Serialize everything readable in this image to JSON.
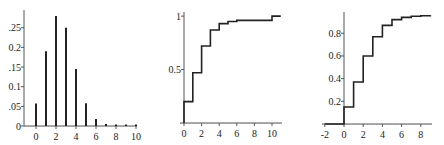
{
  "chart_data": [
    {
      "type": "bar",
      "title": "",
      "xlabel": "",
      "ylabel": "",
      "categories": [
        0,
        1,
        2,
        3,
        4,
        5,
        6,
        7,
        8,
        9,
        10
      ],
      "values": [
        0.057,
        0.19,
        0.28,
        0.25,
        0.145,
        0.058,
        0.018,
        0.005,
        0.002,
        0.001,
        0.0005
      ],
      "xlim": [
        -1,
        10.5
      ],
      "ylim": [
        0,
        0.29
      ],
      "xticks": [
        0,
        2,
        4,
        6,
        8,
        10
      ],
      "xtick_labels": [
        "0",
        "2",
        "4",
        "6",
        "8",
        "10"
      ],
      "yticks": [
        0,
        0.05,
        0.1,
        0.15,
        0.2,
        0.25
      ],
      "ytick_labels": [
        "0",
        ".05",
        "0.1",
        ".15",
        "0.2",
        ".25"
      ],
      "grid": false,
      "legend": null
    },
    {
      "type": "line",
      "style": "step",
      "title": "",
      "xlabel": "",
      "ylabel": "",
      "x": [
        0,
        1,
        2,
        3,
        4,
        5,
        6,
        7,
        8,
        9,
        10,
        11
      ],
      "values": [
        0.2,
        0.47,
        0.72,
        0.87,
        0.93,
        0.95,
        0.96,
        0.96,
        0.96,
        0.96,
        1.0,
        1.0
      ],
      "xlim": [
        -0.5,
        11.2
      ],
      "ylim": [
        0,
        1.02
      ],
      "xticks": [
        0,
        2,
        4,
        6,
        8,
        10
      ],
      "xtick_labels": [
        "0",
        "2",
        "4",
        "6",
        "8",
        "10"
      ],
      "yticks": [
        0.5,
        1
      ],
      "ytick_labels": [
        "0.5",
        "1"
      ],
      "grid": false,
      "legend": null
    },
    {
      "type": "line",
      "style": "step",
      "title": "",
      "xlabel": "",
      "ylabel": "",
      "x": [
        -2,
        0,
        1,
        2,
        3,
        4,
        5,
        6,
        7,
        8,
        9
      ],
      "values": [
        0,
        0.15,
        0.37,
        0.6,
        0.77,
        0.87,
        0.92,
        0.94,
        0.95,
        0.955,
        0.96
      ],
      "xlim": [
        -2,
        9
      ],
      "ylim": [
        0,
        0.97
      ],
      "xticks": [
        -2,
        0,
        2,
        4,
        6,
        8
      ],
      "xtick_labels": [
        "-2",
        "0",
        "2",
        "4",
        "6",
        "8"
      ],
      "yticks": [
        0.2,
        0.4,
        0.6,
        0.8
      ],
      "ytick_labels": [
        "0.2",
        "0.4",
        "0.6",
        "0.8"
      ],
      "grid": false,
      "legend": null
    }
  ]
}
